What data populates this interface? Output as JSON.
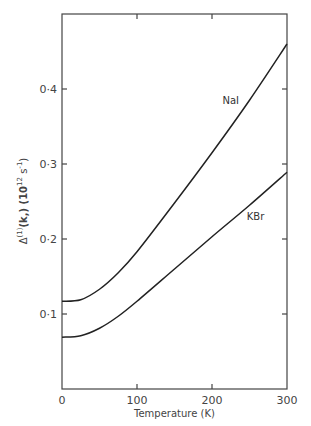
{
  "chart_data": {
    "type": "line",
    "title": "",
    "xlabel": "Temperature  (K)",
    "ylabel": "Δ⁽¹⁾(k,) (10¹² s⁻¹)",
    "ylabel_parts": {
      "main": "Δ",
      "sup1": "(1)",
      "mid": "(k,) (10",
      "sup2": "12",
      "mid2": " s",
      "sup3": "-1",
      "end": ")"
    },
    "xlim": [
      0,
      300
    ],
    "ylim": [
      0,
      0.49
    ],
    "grid": false,
    "legend": "none (inline labels)",
    "x_ticks": [
      0,
      100,
      200,
      300
    ],
    "x_tick_labels": [
      "0",
      "100",
      "200",
      "300"
    ],
    "y_ticks": [
      0.1,
      0.2,
      0.3,
      0.4
    ],
    "y_tick_labels": [
      "0·1",
      "0·2",
      "0·3",
      "0·4"
    ],
    "x": [
      0,
      25,
      50,
      75,
      100,
      150,
      200,
      250,
      300
    ],
    "series": [
      {
        "name": "NaI",
        "label": "NaI",
        "label_at": [
          225,
          0.38
        ],
        "values": [
          0.117,
          0.119,
          0.133,
          0.155,
          0.183,
          0.248,
          0.315,
          0.385,
          0.46
        ]
      },
      {
        "name": "KBr",
        "label": "KBr",
        "label_at": [
          258,
          0.225
        ],
        "values": [
          0.069,
          0.071,
          0.081,
          0.097,
          0.117,
          0.16,
          0.203,
          0.245,
          0.289
        ]
      }
    ]
  }
}
